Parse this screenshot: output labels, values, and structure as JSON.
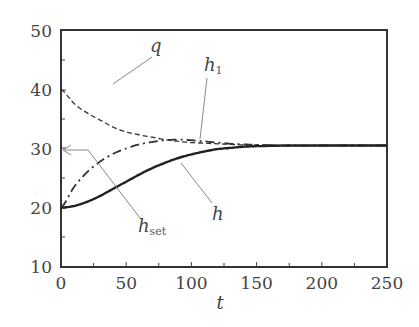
{
  "chart_data": {
    "type": "line",
    "title": "",
    "xlabel": "t",
    "ylabel": "",
    "xlim": [
      0,
      250
    ],
    "ylim": [
      10,
      50
    ],
    "x_ticks": [
      0,
      50,
      100,
      150,
      200,
      250
    ],
    "y_ticks": [
      10,
      20,
      30,
      40,
      50
    ],
    "x_minor_step": 25,
    "y_minor_step": 5,
    "grid": false,
    "legend": "none (inline annotations)",
    "x": [
      0,
      10,
      20,
      30,
      40,
      50,
      60,
      70,
      80,
      90,
      100,
      110,
      120,
      130,
      140,
      150,
      175,
      200,
      225,
      250
    ],
    "series": [
      {
        "name": "q",
        "style": "dashed",
        "values": [
          40.0,
          37.6,
          36.0,
          34.8,
          33.6,
          32.8,
          32.3,
          31.9,
          31.5,
          31.2,
          31.0,
          30.9,
          30.8,
          30.7,
          30.6,
          30.6,
          30.5,
          30.5,
          30.5,
          30.5
        ]
      },
      {
        "name": "h1",
        "style": "dash-dot",
        "values": [
          20.0,
          23.5,
          26.0,
          27.8,
          29.1,
          30.0,
          30.7,
          31.1,
          31.4,
          31.5,
          31.4,
          31.2,
          31.0,
          30.8,
          30.7,
          30.6,
          30.5,
          30.5,
          30.5,
          30.5
        ]
      },
      {
        "name": "h",
        "style": "solid",
        "values": [
          20.0,
          20.3,
          21.0,
          22.0,
          23.2,
          24.4,
          25.6,
          26.7,
          27.6,
          28.4,
          29.0,
          29.5,
          29.9,
          30.1,
          30.3,
          30.4,
          30.5,
          30.5,
          30.5,
          30.5
        ]
      }
    ],
    "annotations": [
      {
        "text": "q",
        "target": "q",
        "type": "leader-line"
      },
      {
        "text": "h",
        "subscript": "1",
        "target": "h1",
        "type": "leader-line"
      },
      {
        "text": "h",
        "target": "h",
        "type": "leader-line"
      },
      {
        "text": "h",
        "subscript": "set",
        "target": "setpoint y=30",
        "type": "arrow to y-axis"
      }
    ],
    "setpoint": 30
  },
  "labels": {
    "x_ticks": [
      "0",
      "50",
      "100",
      "150",
      "200",
      "250"
    ],
    "y_ticks": [
      "10",
      "20",
      "30",
      "40",
      "50"
    ],
    "x_title": "t",
    "q": "q",
    "h1_main": "h",
    "h1_sub": "1",
    "h": "h",
    "hset_main": "h",
    "hset_sub": "set"
  }
}
